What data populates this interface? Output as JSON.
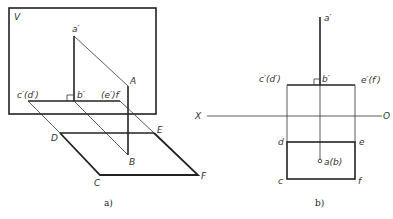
{
  "figure_a": {
    "caption": "a)",
    "plane_label": "V",
    "labels": {
      "a_prime": "a′",
      "A": "A",
      "c_d_prime": "c′(d′)",
      "b_prime": "b′",
      "e_f_prime": "(e′)f′",
      "D": "D",
      "E": "E",
      "B": "B",
      "C": "C",
      "F": "F"
    }
  },
  "figure_b": {
    "caption": "b)",
    "axis_left": "X",
    "axis_right": "O",
    "labels": {
      "a_prime": "a′",
      "c_d_prime": "c′(d′)",
      "b_prime": "b′",
      "e_f_prime": "e′(f′)",
      "d": "d",
      "e": "e",
      "a_b": "a(b)",
      "c": "c",
      "f": "f"
    }
  }
}
